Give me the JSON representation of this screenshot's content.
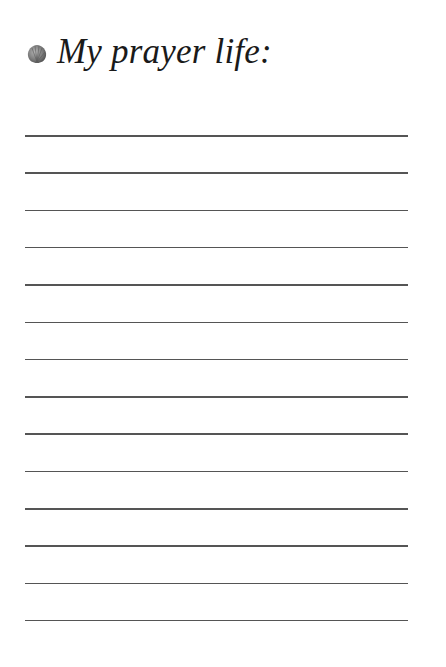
{
  "page": {
    "title": "My prayer life:",
    "icon": "shell-icon",
    "colors": {
      "line": "#555555",
      "text": "#1a1a1a",
      "icon": "#8a8a8a"
    },
    "writing_lines": {
      "count": 14,
      "first_y": 135,
      "spacing": 37.3
    }
  }
}
